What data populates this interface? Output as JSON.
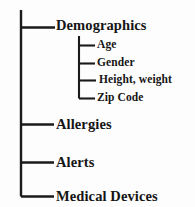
{
  "diagram": {
    "type": "tree",
    "line_color": "#1a1a1a",
    "text_color": "#151515",
    "background_color": "#fdfdfd",
    "root_branches": [
      {
        "id": "demographics",
        "label": "Demographics",
        "children": [
          {
            "id": "age",
            "label": "Age"
          },
          {
            "id": "gender",
            "label": "Gender"
          },
          {
            "id": "height-weight",
            "label": "Height, weight"
          },
          {
            "id": "zip-code",
            "label": "Zip Code"
          }
        ]
      },
      {
        "id": "allergies",
        "label": "Allergies",
        "children": []
      },
      {
        "id": "alerts",
        "label": "Alerts",
        "children": []
      },
      {
        "id": "medical-devices",
        "label": "Medical Devices",
        "children": []
      }
    ]
  },
  "labels": {
    "demographics": "Demographics",
    "age": "Age",
    "gender": "Gender",
    "height_weight": "Height, weight",
    "zip_code": "Zip Code",
    "allergies": "Allergies",
    "alerts": "Alerts",
    "medical_devices": "Medical Devices"
  }
}
